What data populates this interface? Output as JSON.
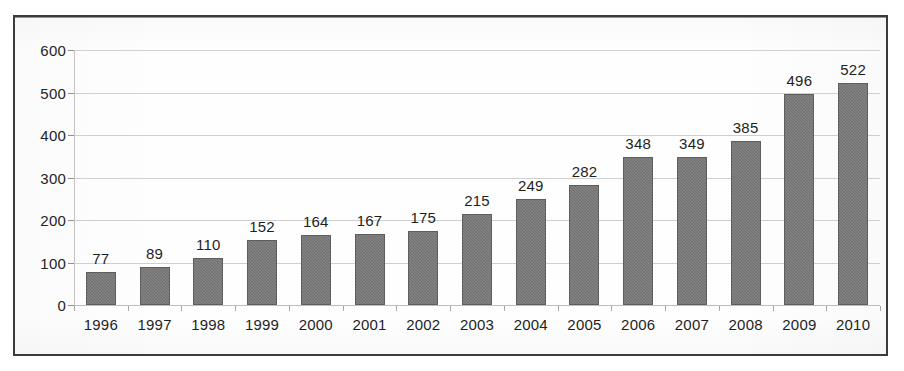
{
  "frame": {
    "border_color": "#3b3b3b",
    "background_color": "#fefefe"
  },
  "style": {
    "bar_color": "#6f6f6f",
    "bar_border_color": "#5e5e5e",
    "gridline_color": "#cfcfcf",
    "text_color": "#1f1f1f"
  },
  "chart_data": {
    "type": "bar",
    "title": "",
    "subtitle": "",
    "xlabel": "",
    "ylabel": "",
    "legend": [],
    "grid": true,
    "legend_position": "none",
    "categories": [
      "1996",
      "1997",
      "1998",
      "1999",
      "2000",
      "2001",
      "2002",
      "2003",
      "2004",
      "2005",
      "2006",
      "2007",
      "2008",
      "2009",
      "2010"
    ],
    "values": [
      77,
      89,
      110,
      152,
      164,
      167,
      175,
      215,
      249,
      282,
      348,
      349,
      385,
      496,
      522
    ],
    "data_labels": [
      "77",
      "89",
      "110",
      "152",
      "164",
      "167",
      "175",
      "215",
      "249",
      "282",
      "348",
      "349",
      "385",
      "496",
      "522"
    ],
    "ylim": [
      0,
      600
    ],
    "ytick_step": 100,
    "ytick_labels": [
      "0",
      "100",
      "200",
      "300",
      "400",
      "500",
      "600"
    ],
    "ytick_values": [
      0,
      100,
      200,
      300,
      400,
      500,
      600
    ]
  }
}
